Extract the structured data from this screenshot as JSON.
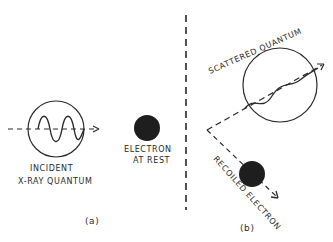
{
  "diagram": {
    "type": "compton-scattering-sketch",
    "stroke_color": "#2a2a2a",
    "fill_color": "#1e1e1e",
    "panel_a": {
      "caption": "(a)",
      "incident_label_line1": "INCIDENT",
      "incident_label_line2": "X-RAY QUANTUM",
      "electron_label_line1": "ELECTRON",
      "electron_label_line2": "AT REST"
    },
    "panel_b": {
      "caption": "(b)",
      "scattered_label": "SCATTERED QUANTUM",
      "recoil_label": "RECOILED ELECTRON"
    }
  }
}
